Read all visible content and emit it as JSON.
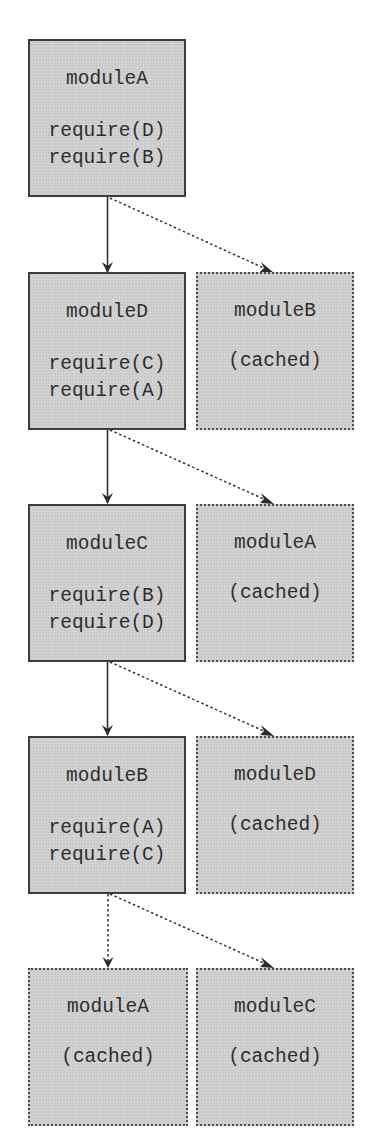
{
  "diagram": {
    "title": "",
    "colors": {
      "node_fill": "#d3d3d3",
      "node_border": "#3c3c3c",
      "text": "#2e2e2e",
      "edge": "#333333",
      "background": "#ffffff"
    },
    "rows": [
      {
        "nodes": [
          {
            "id": "moduleA_1",
            "title": "moduleA",
            "state": "loaded",
            "lines": [
              "require(D)",
              "require(B)"
            ]
          }
        ]
      },
      {
        "nodes": [
          {
            "id": "moduleD_1",
            "title": "moduleD",
            "state": "loaded",
            "lines": [
              "require(C)",
              "require(A)"
            ]
          },
          {
            "id": "moduleB_cached",
            "title": "moduleB",
            "state": "cached",
            "lines": [
              "(cached)"
            ]
          }
        ]
      },
      {
        "nodes": [
          {
            "id": "moduleC_1",
            "title": "moduleC",
            "state": "loaded",
            "lines": [
              "require(B)",
              "require(D)"
            ]
          },
          {
            "id": "moduleA_cached_1",
            "title": "moduleA",
            "state": "cached",
            "lines": [
              "(cached)"
            ]
          }
        ]
      },
      {
        "nodes": [
          {
            "id": "moduleB_1",
            "title": "moduleB",
            "state": "loaded",
            "lines": [
              "require(A)",
              "require(C)"
            ]
          },
          {
            "id": "moduleD_cached",
            "title": "moduleD",
            "state": "cached",
            "lines": [
              "(cached)"
            ]
          }
        ]
      },
      {
        "nodes": [
          {
            "id": "moduleA_cached_2",
            "title": "moduleA",
            "state": "cached",
            "lines": [
              "(cached)"
            ]
          },
          {
            "id": "moduleC_cached",
            "title": "moduleC",
            "state": "cached",
            "lines": [
              "(cached)"
            ]
          }
        ]
      }
    ],
    "edges": [
      {
        "from": "moduleA_1",
        "to": "moduleD_1",
        "style": "solid"
      },
      {
        "from": "moduleA_1",
        "to": "moduleB_cached",
        "style": "dotted"
      },
      {
        "from": "moduleD_1",
        "to": "moduleC_1",
        "style": "solid"
      },
      {
        "from": "moduleD_1",
        "to": "moduleA_cached_1",
        "style": "dotted"
      },
      {
        "from": "moduleC_1",
        "to": "moduleB_1",
        "style": "solid"
      },
      {
        "from": "moduleC_1",
        "to": "moduleD_cached",
        "style": "dotted"
      },
      {
        "from": "moduleB_1",
        "to": "moduleA_cached_2",
        "style": "dotted"
      },
      {
        "from": "moduleB_1",
        "to": "moduleC_cached",
        "style": "dotted"
      }
    ]
  }
}
